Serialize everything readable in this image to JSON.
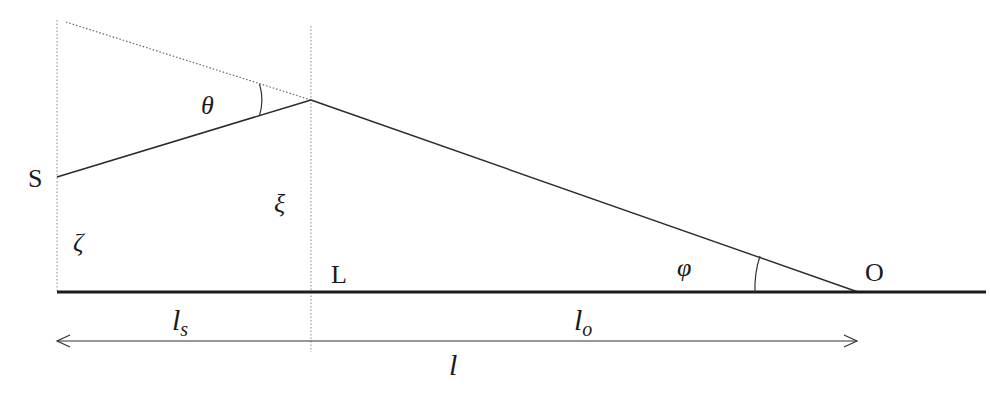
{
  "diagram": {
    "type": "gravitational lens geometry",
    "points": {
      "source": {
        "label": "S",
        "x": 57,
        "y": 177
      },
      "lens": {
        "label": "L",
        "x": 311,
        "y": 100
      },
      "observer": {
        "label": "O",
        "x": 858,
        "y": 292
      }
    },
    "angles": {
      "deflection": "θ",
      "observer_angle": "φ"
    },
    "heights": {
      "source_height": "ζ",
      "impact_parameter": "ξ"
    },
    "distances": {
      "source_lens": {
        "base": "l",
        "sub": "s"
      },
      "lens_observer": {
        "base": "l",
        "sub": "o"
      },
      "total": "l"
    },
    "colors": {
      "line": "#2a2a2a",
      "axis": "#1a1a1a",
      "dotted": "#777777"
    }
  }
}
